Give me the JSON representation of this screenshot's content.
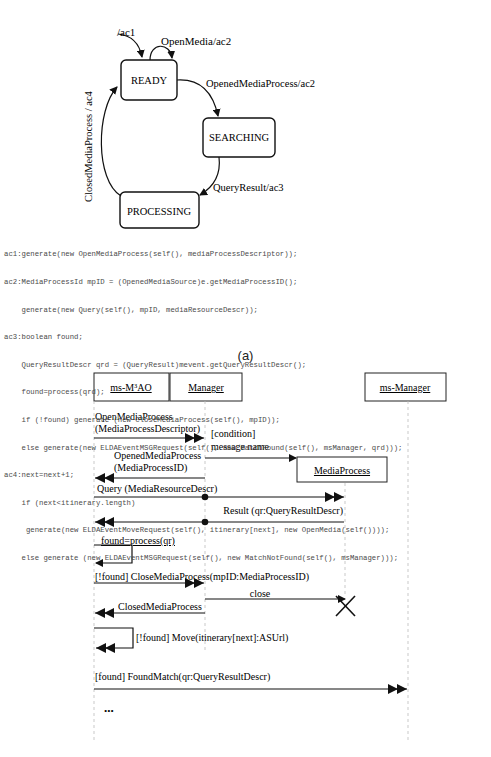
{
  "state_diagram": {
    "initial_label": "/ac1",
    "self_loop_label": "OpenMedia/ac2",
    "states": [
      {
        "name": "READY"
      },
      {
        "name": "SEARCHING"
      },
      {
        "name": "PROCESSING"
      }
    ],
    "transitions": [
      {
        "from": "READY",
        "to": "SEARCHING",
        "label": "OpenedMediaProcess/ac2"
      },
      {
        "from": "SEARCHING",
        "to": "PROCESSING",
        "label": "QueryResult/ac3"
      },
      {
        "from": "PROCESSING",
        "to": "READY",
        "label": "ClosedMediaProcess / ac4"
      }
    ]
  },
  "code": {
    "lines": [
      "ac1:generate(new OpenMediaProcess(self(), mediaProcessDescriptor));",
      "ac2:MediaProcessId mpID = (OpenedMediaSource)e.getMediaProcessID();",
      "    generate(new Query(self(), mpID, mediaResourceDescr));",
      "ac3:boolean found;",
      "    QueryResultDescr qrd = (QueryResult)mevent.getQueryResultDescr();",
      "    found=process(qrd);",
      "    if (!found) generate (new CloseMediaProcess(self(), mpID));",
      "    else generate(new ELDAEventMSGRequest(self(), new MatchFound(self(), msManager, qrd)));",
      "ac4:next=next+1;",
      "    if (next<itinerary.length)",
      "     generate(new ELDAEventMoveRequest(self(), itinerary[next], new OpenMedia(self())));",
      "    else generate (new ELDAEventMSGRequest(self(), new MatchNotFound(self(), msManager)));"
    ]
  },
  "caption": "(a)",
  "sequence_diagram": {
    "lifelines": [
      {
        "name": "ms-M³AO"
      },
      {
        "name": "Manager"
      },
      {
        "name": "ms-Manager"
      },
      {
        "name": "MediaProcess"
      }
    ],
    "messages": [
      {
        "label_line1": "OpenMediaProcess",
        "label_line2": "(MediaProcessDescriptor)"
      },
      {
        "label_line1": "[condition]",
        "label_line2": "message name"
      },
      {
        "label_line1": "OpenedMediaProcess",
        "label_line2": "(MediaProcessID)"
      },
      {
        "label": "Query (MediaResourceDescr)"
      },
      {
        "label": "Result (qr:QueryResultDescr)"
      },
      {
        "label": "found=process(qr)"
      },
      {
        "label": "[!found] CloseMediaProcess(mpID:MediaProcessID)"
      },
      {
        "label": "close"
      },
      {
        "label": "ClosedMediaProcess"
      },
      {
        "label": "[!found] Move(itinerary[next]:ASUrl)"
      },
      {
        "label": "[found] FoundMatch(qr:QueryResultDescr)"
      },
      {
        "label": "..."
      }
    ]
  }
}
